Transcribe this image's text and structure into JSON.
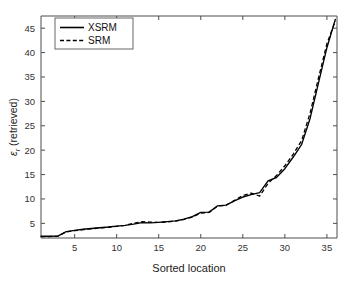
{
  "chart_data": {
    "type": "line",
    "title": "",
    "xlabel": "Sorted location",
    "ylabel": "εr (retrieved)",
    "ylabel_symbol": "ε",
    "ylabel_subscript": "r",
    "ylabel_suffix": " (retrieved)",
    "xlim": [
      1,
      36.2
    ],
    "ylim": [
      2.0,
      47.5
    ],
    "xticks": [
      5,
      10,
      15,
      20,
      25,
      30,
      35
    ],
    "yticks": [
      5,
      10,
      15,
      20,
      25,
      30,
      35,
      40,
      45
    ],
    "xtick_labels": [
      "5",
      "10",
      "15",
      "20",
      "25",
      "30",
      "35"
    ],
    "ytick_labels": [
      "5",
      "10",
      "15",
      "20",
      "25",
      "30",
      "35",
      "40",
      "45"
    ],
    "grid": false,
    "legend_position": "upper-left",
    "x": [
      1,
      2,
      3,
      4,
      5,
      6,
      7,
      8,
      9,
      10,
      11,
      12,
      13,
      14,
      15,
      16,
      17,
      18,
      19,
      20,
      21,
      22,
      23,
      24,
      25,
      26,
      27,
      28,
      29,
      30,
      31,
      32,
      33,
      34,
      35,
      36
    ],
    "series": [
      {
        "name": "XSRM",
        "style": "solid",
        "color": "#000000",
        "values": [
          2.35,
          2.35,
          2.4,
          3.3,
          3.55,
          3.8,
          3.95,
          4.1,
          4.25,
          4.45,
          4.6,
          4.85,
          5.15,
          5.1,
          5.2,
          5.35,
          5.5,
          5.85,
          6.4,
          7.25,
          7.3,
          8.6,
          8.75,
          9.6,
          10.4,
          10.9,
          11.3,
          13.7,
          14.4,
          16.2,
          18.6,
          21.2,
          26.5,
          33.8,
          41.0,
          46.8
        ]
      },
      {
        "name": "SRM",
        "style": "dashed",
        "color": "#000000",
        "values": [
          2.3,
          2.3,
          2.35,
          3.25,
          3.5,
          3.7,
          3.9,
          4.05,
          4.2,
          4.4,
          4.6,
          5.0,
          5.35,
          5.25,
          5.2,
          5.3,
          5.45,
          5.8,
          6.3,
          7.1,
          7.25,
          8.55,
          8.7,
          9.7,
          10.7,
          11.2,
          10.6,
          13.2,
          14.8,
          16.8,
          19.2,
          22.0,
          27.6,
          34.8,
          41.8,
          46.5
        ]
      }
    ]
  },
  "legend": {
    "entries": [
      {
        "label": "XSRM"
      },
      {
        "label": "SRM"
      }
    ]
  }
}
